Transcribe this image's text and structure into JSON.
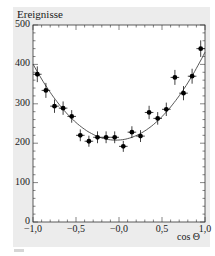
{
  "chart_data": {
    "type": "scatter",
    "title": "",
    "xlabel": "cos Θ",
    "ylabel": "Ereignisse",
    "annotation": "ALEPH",
    "xlim": [
      -1.0,
      1.0
    ],
    "ylim": [
      0,
      500
    ],
    "x_ticks": [
      "−1,0",
      "−0,5",
      "−0,0",
      "0,5",
      "1,0"
    ],
    "y_ticks": [
      "0",
      "100",
      "200",
      "300",
      "400",
      "500"
    ],
    "grid": false,
    "legend": null,
    "series": [
      {
        "name": "Data (with error bars)",
        "style": "points",
        "x": [
          -0.95,
          -0.85,
          -0.75,
          -0.65,
          -0.55,
          -0.45,
          -0.35,
          -0.25,
          -0.15,
          -0.05,
          0.05,
          0.15,
          0.25,
          0.35,
          0.45,
          0.55,
          0.65,
          0.75,
          0.85,
          0.95
        ],
        "y": [
          375,
          334,
          294,
          289,
          268,
          220,
          205,
          215,
          215,
          215,
          192,
          228,
          218,
          278,
          263,
          286,
          367,
          327,
          370,
          440
        ],
        "yerr": [
          20,
          19,
          17,
          17,
          16,
          15,
          14,
          15,
          15,
          15,
          14,
          15,
          15,
          17,
          16,
          17,
          19,
          18,
          19,
          21
        ]
      },
      {
        "name": "Fit",
        "style": "line",
        "model": "a(1 + cos²Θ) + b·cosΘ",
        "x": [
          -1.0,
          -0.8,
          -0.6,
          -0.4,
          -0.2,
          0.0,
          0.2,
          0.4,
          0.6,
          0.8,
          1.0
        ],
        "y": [
          390,
          330,
          278,
          240,
          216,
          208,
          216,
          242,
          282,
          340,
          420
        ]
      }
    ]
  }
}
